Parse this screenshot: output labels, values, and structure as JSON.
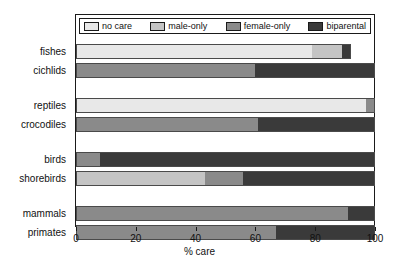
{
  "chart_data": {
    "type": "bar",
    "orientation": "horizontal",
    "stacked": true,
    "title": "",
    "xlabel": "% care",
    "ylabel": "",
    "xlim": [
      0,
      100
    ],
    "xticks": [
      0,
      20,
      40,
      60,
      80,
      100
    ],
    "xtick_labels": [
      "0",
      "20",
      "40",
      "60",
      "80",
      "100"
    ],
    "grid": false,
    "legend_position": "top-inside",
    "categories": [
      "fishes",
      "cichlids",
      "reptiles",
      "crocodiles",
      "birds",
      "shorebirds",
      "mammals",
      "primates"
    ],
    "series": [
      {
        "name": "no care",
        "color": "#e8e8e8",
        "values": [
          79,
          0,
          97,
          0,
          0,
          0,
          0,
          0
        ]
      },
      {
        "name": "male-only",
        "color": "#c4c4c4",
        "values": [
          10,
          0,
          0,
          0,
          0,
          43,
          0,
          0
        ]
      },
      {
        "name": "female-only",
        "color": "#8a8a8a",
        "values": [
          0,
          60,
          3,
          61,
          8,
          13,
          91,
          67
        ]
      },
      {
        "name": "biparental",
        "color": "#3a3a3a",
        "values": [
          3,
          40,
          0,
          39,
          92,
          44,
          9,
          33
        ]
      }
    ],
    "row_totals": [
      92,
      100,
      100,
      100,
      100,
      100,
      100,
      100
    ],
    "group_breaks": [
      2,
      4,
      6
    ]
  },
  "legend": {
    "entries": [
      {
        "label": "no care",
        "color": "#e8e8e8"
      },
      {
        "label": "male-only",
        "color": "#c4c4c4"
      },
      {
        "label": "female-only",
        "color": "#8a8a8a"
      },
      {
        "label": "biparental",
        "color": "#3a3a3a"
      }
    ]
  },
  "axis": {
    "x_title": "% care",
    "tick_labels": [
      "0",
      "20",
      "40",
      "60",
      "80",
      "100"
    ]
  }
}
